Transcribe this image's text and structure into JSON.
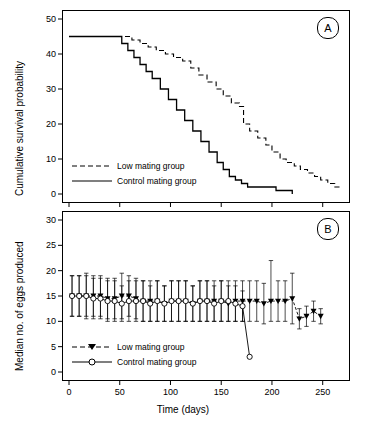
{
  "chart_data": [
    {
      "id": "panelA",
      "type": "line",
      "title": "",
      "tag": "A",
      "xlabel": "",
      "ylabel": "Cumulative survival probability",
      "xlim": [
        0,
        270
      ],
      "ylim": [
        0,
        50
      ],
      "xticks": [
        0,
        50,
        100,
        150,
        200,
        250
      ],
      "yticks": [
        0,
        10,
        20,
        30,
        40,
        50
      ],
      "grid": false,
      "legend_position": "inside-left",
      "series": [
        {
          "name": "Low mating group",
          "style": "dashed",
          "x": [
            0,
            55,
            62,
            70,
            78,
            86,
            95,
            103,
            112,
            120,
            128,
            136,
            145,
            152,
            160,
            168,
            172,
            178,
            186,
            194,
            200,
            208,
            214,
            222,
            228,
            235,
            242,
            248,
            255,
            262,
            268
          ],
          "y": [
            45,
            45,
            44,
            43,
            42,
            41,
            40,
            39,
            38,
            36,
            34,
            32,
            30,
            28,
            26,
            25,
            20,
            18,
            16,
            14,
            12,
            10,
            9,
            8,
            7,
            6,
            5,
            4,
            3,
            2,
            2
          ]
        },
        {
          "name": "Control mating group",
          "style": "solid",
          "x": [
            0,
            45,
            52,
            58,
            64,
            70,
            76,
            82,
            90,
            98,
            106,
            114,
            122,
            130,
            138,
            146,
            152,
            158,
            164,
            170,
            176,
            182,
            188,
            196,
            204,
            212,
            220
          ],
          "y": [
            45,
            45,
            43,
            41,
            39,
            37,
            35,
            33,
            30,
            27,
            24,
            21,
            18,
            15,
            12,
            9,
            7,
            5,
            4,
            3,
            2,
            2,
            2,
            2,
            1,
            1,
            0
          ]
        }
      ]
    },
    {
      "id": "panelB",
      "type": "scatter-line-errorbars",
      "title": "",
      "tag": "B",
      "xlabel": "Time (days)",
      "ylabel": "Median no. of eggs produced",
      "xlim": [
        0,
        270
      ],
      "ylim": [
        0,
        30
      ],
      "xticks": [
        0,
        50,
        100,
        150,
        200,
        250
      ],
      "yticks": [
        0,
        5,
        10,
        15,
        20,
        25,
        30
      ],
      "grid": false,
      "legend_position": "inside-left",
      "series": [
        {
          "name": "Low mating group",
          "style": "dashed",
          "marker": "triangle-down",
          "x": [
            3,
            10,
            17,
            24,
            31,
            38,
            45,
            52,
            59,
            66,
            73,
            80,
            87,
            94,
            101,
            108,
            115,
            122,
            129,
            136,
            143,
            150,
            157,
            164,
            171,
            178,
            185,
            192,
            199,
            206,
            213,
            220,
            227,
            234,
            241,
            248
          ],
          "y": [
            15,
            15,
            15,
            15,
            15,
            14.5,
            14.5,
            15,
            15,
            14.5,
            14,
            14,
            14,
            13.5,
            14,
            14,
            14,
            13.5,
            14,
            14,
            14,
            14,
            13.5,
            14,
            14,
            14,
            14,
            13.5,
            14,
            14,
            14,
            14.5,
            10.5,
            11,
            12,
            11
          ],
          "yerr_low": [
            4,
            4,
            4.5,
            4,
            4,
            4,
            4,
            4.5,
            4,
            4,
            4,
            4,
            4,
            3.5,
            4,
            4,
            4,
            3.5,
            4,
            4,
            4,
            4,
            3.5,
            4,
            4,
            4,
            4,
            4,
            4,
            4,
            4,
            5,
            2,
            2,
            2,
            1.5
          ],
          "yerr_high": [
            4,
            4,
            4.5,
            4,
            4,
            4,
            4,
            4.5,
            4,
            4,
            4,
            4,
            4,
            3.5,
            4,
            4,
            4,
            3.5,
            4,
            4,
            4,
            4,
            3.5,
            4,
            4,
            4,
            4,
            4,
            8,
            4,
            4,
            5,
            2,
            2,
            2,
            1.5
          ]
        },
        {
          "name": "Control mating group",
          "style": "solid",
          "marker": "circle-open",
          "x": [
            3,
            10,
            17,
            24,
            31,
            38,
            45,
            52,
            59,
            66,
            73,
            80,
            87,
            94,
            101,
            108,
            115,
            122,
            129,
            136,
            143,
            150,
            157,
            164,
            171,
            178
          ],
          "y": [
            15,
            15,
            15,
            14.5,
            14.5,
            14,
            14,
            13.5,
            14,
            14,
            14,
            13.5,
            14,
            13.5,
            14,
            14,
            14,
            13.5,
            14,
            14,
            13.5,
            14,
            14,
            13.5,
            13,
            3
          ],
          "yerr_low": [
            4,
            4,
            4,
            4,
            4,
            4,
            4,
            3.5,
            4,
            4,
            4,
            3.5,
            4,
            3.5,
            4,
            4,
            4,
            3.5,
            4,
            4,
            3.5,
            4,
            4,
            3.5,
            3,
            0
          ],
          "yerr_high": [
            4,
            4,
            4,
            4,
            4,
            4,
            4,
            3.5,
            4,
            4,
            4,
            3.5,
            4,
            3.5,
            4,
            4,
            4,
            3.5,
            4,
            4,
            3.5,
            4,
            4,
            3.5,
            3,
            0
          ]
        }
      ]
    }
  ],
  "panelA": {
    "tag": "A",
    "ylabel": "Cumulative survival probability",
    "legend": [
      {
        "label": "Low mating group",
        "style": "dashed"
      },
      {
        "label": "Control mating group",
        "style": "solid"
      }
    ],
    "yticks": [
      "0",
      "10",
      "20",
      "30",
      "40",
      "50"
    ],
    "xticks": [
      "0",
      "50",
      "100",
      "150",
      "200",
      "250"
    ]
  },
  "panelB": {
    "tag": "B",
    "ylabel": "Median no. of eggs produced",
    "xlabel": "Time (days)",
    "legend": [
      {
        "label": "Low mating group",
        "style": "dashed"
      },
      {
        "label": "Control mating group",
        "style": "solid"
      }
    ],
    "yticks": [
      "0",
      "5",
      "10",
      "15",
      "20",
      "25",
      "30"
    ],
    "xticks": [
      "0",
      "50",
      "100",
      "150",
      "200",
      "250"
    ]
  },
  "colors": {
    "axis": "#000000",
    "background": "#ffffff",
    "line": "#000000"
  }
}
